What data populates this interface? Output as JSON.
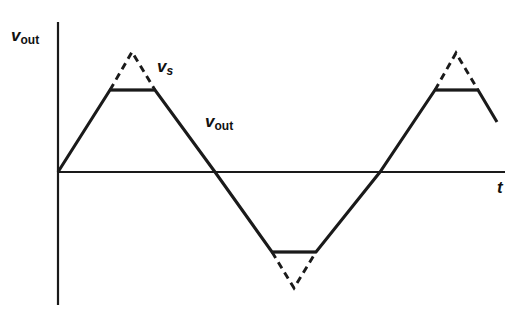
{
  "figure": {
    "background_color": "#ffffff",
    "line_color": "#1a1a1a",
    "width": 528,
    "height": 322
  },
  "axes": {
    "vertical": {
      "name": "vertical-axis",
      "label_main": "v",
      "label_sub": "out",
      "x": 58,
      "y_top": 22,
      "y_bottom": 305
    },
    "horizontal": {
      "name": "time-axis",
      "label_main": "t",
      "label_sub": "",
      "y": 172,
      "x_left": 58,
      "x_right": 505
    },
    "origin": {
      "x": 58,
      "y": 172
    }
  },
  "labels": {
    "vout_axis": {
      "main": "v",
      "sub": "out"
    },
    "vs_curve": {
      "main": "v",
      "sub": "s"
    },
    "vout_curve": {
      "main": "v",
      "sub": "out"
    },
    "t_axis": {
      "main": "t",
      "sub": ""
    }
  },
  "chart_data": {
    "type": "line",
    "xlabel": "t",
    "ylabel": "v_out",
    "grid": false,
    "legend": "none",
    "axis_origin_px": {
      "x": 58,
      "y": 172
    },
    "xlim_px": [
      58,
      505
    ],
    "ylim_px": [
      22,
      305
    ],
    "clip_level_positive_px_y": 90,
    "clip_level_negative_px_y": 252,
    "unclipped_peak_px_y": 52,
    "unclipped_trough_px_y": 288,
    "zero_crossings_px_x": [
      58,
      215,
      380
    ],
    "series": [
      {
        "name": "v_out",
        "style": "solid",
        "description": "Clipped triangular wave (flat tops/bottoms at the clipping levels)",
        "points_px": [
          [
            58,
            172
          ],
          [
            110,
            90
          ],
          [
            155,
            90
          ],
          [
            215,
            172
          ],
          [
            272,
            252
          ],
          [
            316,
            252
          ],
          [
            380,
            172
          ],
          [
            435,
            90
          ],
          [
            478,
            90
          ],
          [
            497,
            122
          ]
        ]
      },
      {
        "name": "v_s",
        "style": "dashed",
        "description": "Unclipped source triangular wave peaks shown dashed above/below the clipping levels",
        "segments_px": [
          [
            [
              110,
              90
            ],
            [
              132,
              52
            ],
            [
              155,
              90
            ]
          ],
          [
            [
              272,
              252
            ],
            [
              294,
              288
            ],
            [
              316,
              252
            ]
          ],
          [
            [
              435,
              90
            ],
            [
              456,
              53
            ],
            [
              478,
              90
            ]
          ]
        ]
      }
    ]
  }
}
